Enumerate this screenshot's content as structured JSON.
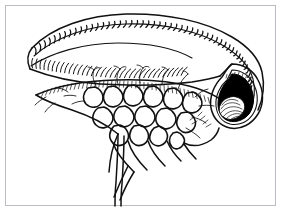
{
  "figure": {
    "kind": "scientific-line-illustration",
    "subject_label": "curved comb-bearing appendage with reticulate lamella and dark terminal aperture",
    "background_color": "#ffffff",
    "ink_color": "#111111",
    "frame_color": "#b9bcc0",
    "aperture_fill_color": "#000000",
    "canvas_width": 282,
    "canvas_height": 213,
    "frame": {
      "x": 5,
      "y": 5,
      "width": 271,
      "height": 201
    },
    "parts": [
      {
        "id": "upper-comb-band",
        "label": "upper comb band",
        "description": "dense row of closely spaced curved teeth along the outer dorsal margin"
      },
      {
        "id": "lower-comb-band",
        "label": "lower comb band",
        "description": "second inner row of curved teeth parallel to the dorsal margin"
      },
      {
        "id": "reticulate-lamella",
        "label": "reticulate lamella",
        "description": "fan of rounded polygonal cells converging downward into a stalk"
      },
      {
        "id": "stalk",
        "label": "basal stalk",
        "description": "paired strands descending from the cell fan past the lower edge"
      },
      {
        "id": "terminal-aperture",
        "label": "terminal aperture",
        "description": "black funnel-shaped opening at the right end with a thickened lip"
      },
      {
        "id": "papilla",
        "label": "inner papilla",
        "description": "hatched oval body seated at the lower left of the aperture"
      },
      {
        "id": "setae",
        "label": "marginal setae",
        "description": "slender branching hairs projecting from the lamellar margin"
      }
    ],
    "comb": {
      "upper_tooth_count": 38,
      "lower_tooth_count": 30
    },
    "cells": {
      "count": 16
    }
  }
}
